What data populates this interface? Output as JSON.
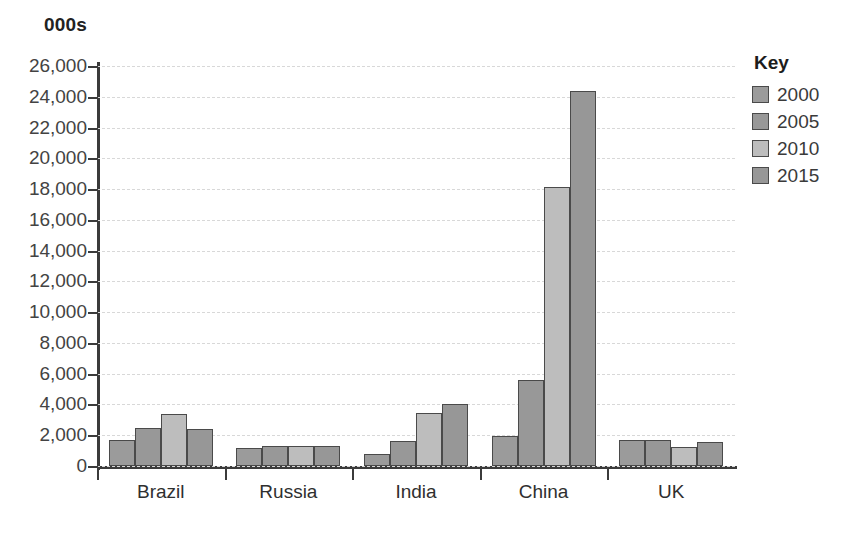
{
  "chart_data": {
    "type": "bar",
    "title": "",
    "subtitle": "",
    "xlabel": "",
    "ylabel": "000s",
    "unit_label": "000s",
    "ylim": [
      0,
      26000
    ],
    "ytick_step": 2000,
    "ytick_labels": [
      "26,000",
      "24,000",
      "22,000",
      "20,000",
      "18,000",
      "16,000",
      "14,000",
      "12,000",
      "10,000",
      "8,000",
      "6,000",
      "4,000",
      "2,000",
      "0"
    ],
    "ytick_values": [
      26000,
      24000,
      22000,
      20000,
      18000,
      16000,
      14000,
      12000,
      10000,
      8000,
      6000,
      4000,
      2000,
      0
    ],
    "grid": true,
    "grid_style": "dashed",
    "legend_title": "Key",
    "legend_position": "right",
    "categories": [
      "Brazil",
      "Russia",
      "India",
      "China",
      "UK"
    ],
    "series": [
      {
        "name": "2000",
        "color": "#9b9b9b",
        "values": [
          1700,
          1150,
          800,
          1950,
          1700
        ]
      },
      {
        "name": "2005",
        "color": "#989898",
        "values": [
          2500,
          1300,
          1600,
          5600,
          1700
        ]
      },
      {
        "name": "2010",
        "color": "#bdbdbd",
        "values": [
          3400,
          1300,
          3450,
          18150,
          1250
        ]
      },
      {
        "name": "2015",
        "color": "#979797",
        "values": [
          2400,
          1300,
          4050,
          24400,
          1550
        ]
      }
    ]
  },
  "legend": {
    "title": "Key",
    "items": [
      {
        "label": "2000",
        "color": "#9b9b9b"
      },
      {
        "label": "2005",
        "color": "#989898"
      },
      {
        "label": "2010",
        "color": "#bdbdbd"
      },
      {
        "label": "2015",
        "color": "#979797"
      }
    ]
  }
}
